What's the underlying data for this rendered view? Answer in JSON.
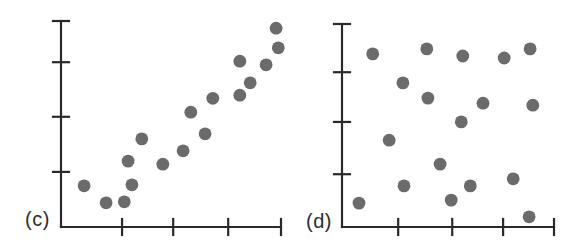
{
  "figure": {
    "background": "#ffffff",
    "panel_labels": [
      "(c)",
      "(d)"
    ]
  },
  "style": {
    "dot_color": "#6b6b6b",
    "axis_color": "#2a2a2a",
    "label_color": "#2e2e2e",
    "dot_radius": 6.4,
    "axis_stroke_width": 2.2,
    "tick_half_length": 8
  },
  "chart_data": [
    {
      "id": "c",
      "type": "scatter",
      "label": "(c)",
      "title": "",
      "xlabel": "",
      "ylabel": "",
      "xlim": [
        0,
        4
      ],
      "ylim": [
        0,
        4
      ],
      "grid": false,
      "legend": false,
      "tick_labels_visible": false,
      "x_ticks": [
        1.11,
        2.04,
        3.04,
        4
      ],
      "y_ticks": [
        1.07,
        2.14,
        3.2,
        4
      ],
      "points": [
        [
          0.42,
          0.8
        ],
        [
          0.82,
          0.47
        ],
        [
          1.15,
          0.49
        ],
        [
          1.22,
          1.28
        ],
        [
          1.29,
          0.82
        ],
        [
          1.47,
          1.71
        ],
        [
          1.85,
          1.22
        ],
        [
          2.22,
          1.48
        ],
        [
          2.36,
          2.23
        ],
        [
          2.62,
          1.81
        ],
        [
          2.76,
          2.5
        ],
        [
          3.25,
          3.22
        ],
        [
          3.25,
          2.56
        ],
        [
          3.44,
          2.8
        ],
        [
          3.73,
          3.15
        ],
        [
          3.91,
          3.86
        ],
        [
          3.95,
          3.48
        ]
      ]
    },
    {
      "id": "d",
      "type": "scatter",
      "label": "(d)",
      "title": "",
      "xlabel": "",
      "ylabel": "",
      "xlim": [
        0,
        4
      ],
      "ylim": [
        0,
        4
      ],
      "grid": false,
      "legend": false,
      "tick_labels_visible": false,
      "x_ticks": [
        1.06,
        2.08,
        3.04,
        4
      ],
      "y_ticks": [
        1.04,
        2.07,
        3.05,
        4
      ],
      "points": [
        [
          0.32,
          0.47
        ],
        [
          0.58,
          3.41
        ],
        [
          0.89,
          1.71
        ],
        [
          1.15,
          2.84
        ],
        [
          1.17,
          0.81
        ],
        [
          1.6,
          3.51
        ],
        [
          1.62,
          2.54
        ],
        [
          1.85,
          1.24
        ],
        [
          2.06,
          0.53
        ],
        [
          2.25,
          2.07
        ],
        [
          2.28,
          3.37
        ],
        [
          2.42,
          0.81
        ],
        [
          2.66,
          2.44
        ],
        [
          3.06,
          3.33
        ],
        [
          3.23,
          0.95
        ],
        [
          3.53,
          0.2
        ],
        [
          3.55,
          3.51
        ],
        [
          3.6,
          2.4
        ]
      ]
    }
  ]
}
